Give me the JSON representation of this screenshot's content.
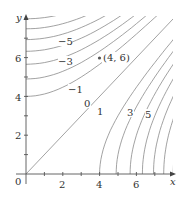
{
  "chart_data": {
    "type": "contour",
    "title": "",
    "xlabel": "x",
    "ylabel": "y",
    "xlim": [
      0,
      8
    ],
    "ylim": [
      0,
      8
    ],
    "grid": false,
    "x_ticks": [
      1,
      2,
      3,
      4,
      5,
      6,
      7
    ],
    "y_ticks": [
      1,
      2,
      3,
      4,
      5,
      6,
      7
    ],
    "x_tick_labels": [
      "0",
      "2",
      "4",
      "6"
    ],
    "y_tick_labels": [
      "2",
      "4",
      "6"
    ],
    "origin_label": "0",
    "levels": [
      -7,
      -6,
      -5,
      -4,
      -3,
      -2,
      -1,
      0,
      1,
      2,
      3,
      4,
      5,
      6,
      7,
      8
    ],
    "level_labels": [
      {
        "text": "-5",
        "x": 2.1,
        "y": 6.85
      },
      {
        "text": "-3",
        "x": 2.1,
        "y": 5.8
      },
      {
        "text": "-1",
        "x": 2.7,
        "y": 3.75
      },
      {
        "text": "0",
        "x": 3.05,
        "y": 3.4
      },
      {
        "text": "1",
        "x": 3.75,
        "y": 3.0
      },
      {
        "text": "3",
        "x": 5.35,
        "y": 3.0
      },
      {
        "text": "5",
        "x": 6.35,
        "y": 2.8
      }
    ],
    "marked_point": {
      "x": 4,
      "y": 6,
      "label": "(4, 6)"
    },
    "line_color": "#8a8a8a",
    "axis_color": "#555555"
  },
  "axes": {
    "x_label": "x",
    "y_label": "y",
    "origin": "0",
    "x_tick_2": "2",
    "x_tick_4": "4",
    "x_tick_6": "6",
    "y_tick_2": "2",
    "y_tick_4": "4",
    "y_tick_6": "6"
  },
  "point": {
    "label": "(4, 6)"
  },
  "labels": {
    "m5": "−5",
    "m3": "−3",
    "m1": "−1",
    "z": "0",
    "p1": "1",
    "p3": "3",
    "p5": "5"
  }
}
